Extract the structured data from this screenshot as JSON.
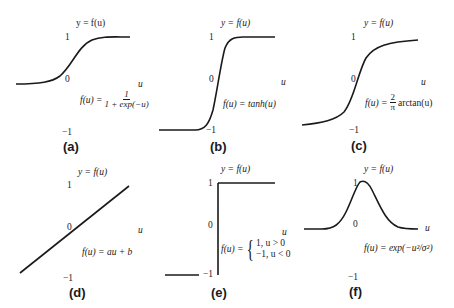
{
  "figure": {
    "axis_label_y": "y = f(u)",
    "axis_label_x": "u",
    "tick_top": "1",
    "tick_mid": "0",
    "tick_bottom": "−1",
    "line_color": "#1a1a1a",
    "panels": [
      {
        "tag": "(a)",
        "name": "sigmoid",
        "formula_lhs": "f(u) =",
        "formula_num": "1",
        "formula_den": "1 + exp(−u)"
      },
      {
        "tag": "(b)",
        "name": "tanh",
        "formula": "f(u) = tanh(u)"
      },
      {
        "tag": "(c)",
        "name": "arctan",
        "formula_lhs": "f(u) =",
        "formula_num": "2",
        "formula_den": "π",
        "formula_rhs": "arctan(u)"
      },
      {
        "tag": "(d)",
        "name": "linear",
        "formula": "f(u) = au + b"
      },
      {
        "tag": "(e)",
        "name": "step",
        "formula_lhs": "f(u) =",
        "case1": "1,  u > 0",
        "case2": "−1,  u < 0"
      },
      {
        "tag": "(f)",
        "name": "gaussian",
        "formula": "f(u) = exp(−u²/σ²)"
      }
    ]
  }
}
